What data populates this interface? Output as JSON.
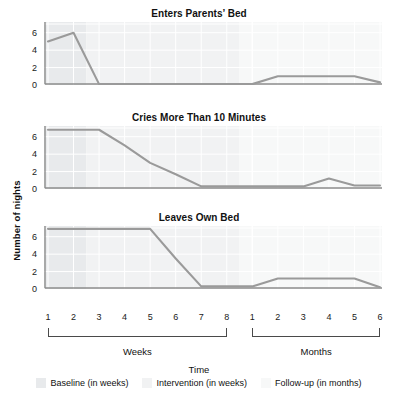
{
  "figure": {
    "ylabel": "Number of nights",
    "xlabel": "Time"
  },
  "legend": [
    {
      "label": "Baseline (in weeks)",
      "color": "#e8eaec"
    },
    {
      "label": "Intervention (in weeks)",
      "color": "#f1f2f3"
    },
    {
      "label": "Follow-up (in months)",
      "color": "#f7f8f8"
    }
  ],
  "axis": {
    "y_ticks": [
      "0",
      "2",
      "4",
      "6"
    ],
    "y_values": [
      0,
      2,
      4,
      6
    ],
    "ylim": [
      0,
      7
    ],
    "x_ticks": [
      "1",
      "2",
      "3",
      "4",
      "5",
      "6",
      "7",
      "8",
      "1",
      "2",
      "3",
      "4",
      "5",
      "6"
    ],
    "brackets": [
      {
        "label": "Weeks",
        "from": 0,
        "to": 7
      },
      {
        "label": "Months",
        "from": 8,
        "to": 13
      }
    ]
  },
  "phases": [
    {
      "name": "baseline",
      "from": 0,
      "to": 2,
      "color": "#e8eaec"
    },
    {
      "name": "intervention",
      "from": 2,
      "to": 8,
      "color": "#f1f2f3"
    },
    {
      "name": "follow-up",
      "from": 8,
      "to": 14,
      "color": "#f7f8f8"
    }
  ],
  "series_color": "#9a9a9a",
  "chart_data": [
    {
      "type": "line",
      "title": "Enters Parents’ Bed",
      "xlabel": "Time",
      "ylabel": "Number of nights",
      "ylim": [
        0,
        7
      ],
      "grid": true,
      "legend_position": "bottom",
      "categories": [
        "W1",
        "W2",
        "W3",
        "W4",
        "W5",
        "W6",
        "W7",
        "W8",
        "M1",
        "M2",
        "M3",
        "M4",
        "M5",
        "M6"
      ],
      "tick_labels": [
        "1",
        "2",
        "3",
        "4",
        "5",
        "6",
        "7",
        "8",
        "1",
        "2",
        "3",
        "4",
        "5",
        "6"
      ],
      "values": [
        5,
        6,
        0.1,
        0.1,
        0.1,
        0.1,
        0.1,
        0.1,
        0.1,
        1,
        1,
        1,
        1,
        0.3
      ]
    },
    {
      "type": "line",
      "title": "Cries More Than 10 Minutes",
      "xlabel": "Time",
      "ylabel": "Number of nights",
      "ylim": [
        0,
        7
      ],
      "grid": true,
      "legend_position": "bottom",
      "categories": [
        "W1",
        "W2",
        "W3",
        "W4",
        "W5",
        "W6",
        "W7",
        "W8",
        "M1",
        "M2",
        "M3",
        "M4",
        "M5",
        "M6"
      ],
      "tick_labels": [
        "1",
        "2",
        "3",
        "4",
        "5",
        "6",
        "7",
        "8",
        "1",
        "2",
        "3",
        "4",
        "5",
        "6"
      ],
      "values": [
        6.8,
        6.8,
        6.8,
        5,
        3,
        1.7,
        0.3,
        0.3,
        0.3,
        0.3,
        0.3,
        1.2,
        0.4,
        0.4
      ]
    },
    {
      "type": "line",
      "title": "Leaves Own Bed",
      "xlabel": "Time",
      "ylabel": "Number of nights",
      "ylim": [
        0,
        7
      ],
      "grid": true,
      "legend_position": "bottom",
      "categories": [
        "W1",
        "W2",
        "W3",
        "W4",
        "W5",
        "W6",
        "W7",
        "W8",
        "M1",
        "M2",
        "M3",
        "M4",
        "M5",
        "M6"
      ],
      "tick_labels": [
        "1",
        "2",
        "3",
        "4",
        "5",
        "6",
        "7",
        "8",
        "1",
        "2",
        "3",
        "4",
        "5",
        "6"
      ],
      "values": [
        6.9,
        6.9,
        6.9,
        6.9,
        6.9,
        3.5,
        0.3,
        0.3,
        0.3,
        1.2,
        1.2,
        1.2,
        1.2,
        0.2
      ]
    }
  ]
}
